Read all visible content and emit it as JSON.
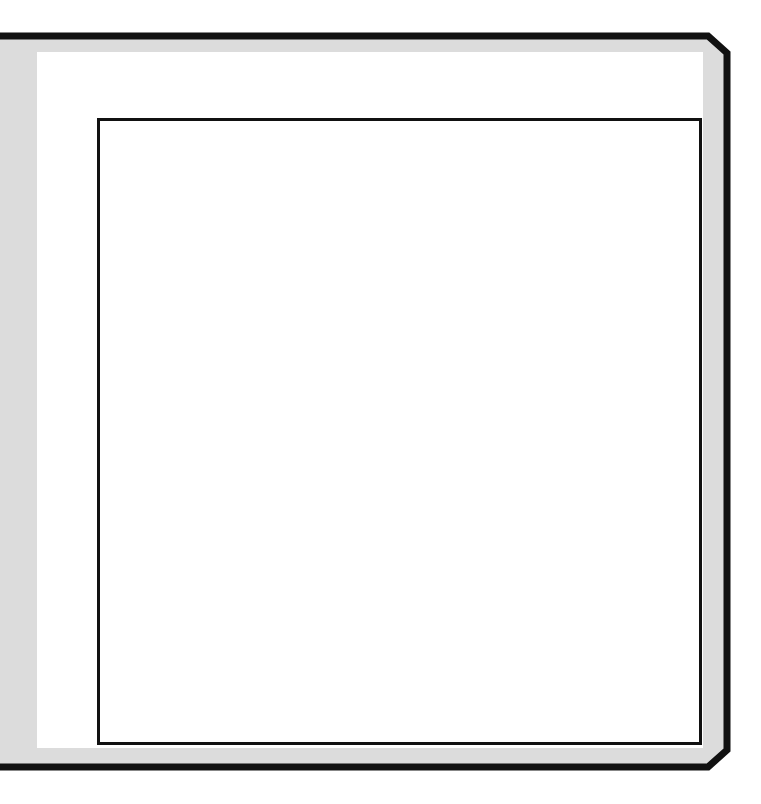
{
  "puzzle": {
    "rows": 10,
    "cols": 10,
    "col_clues": [
      {
        "col": 1,
        "value": "5"
      },
      {
        "col": 2,
        "value": "4"
      },
      {
        "col": 4,
        "value": "4"
      },
      {
        "col": 5,
        "value": "3"
      },
      {
        "col": 8,
        "value": "3"
      },
      {
        "col": 9,
        "value": "4"
      }
    ],
    "row_clues": [
      {
        "row": 1,
        "value": "6"
      },
      {
        "row": 4,
        "value": "3"
      },
      {
        "row": 6,
        "value": "3"
      },
      {
        "row": 7,
        "value": "6"
      },
      {
        "row": 10,
        "value": "4"
      }
    ],
    "dots": [
      {
        "row": 4,
        "col": 2
      },
      {
        "row": 6,
        "col": 1
      }
    ]
  },
  "colors": {
    "frame": "#111111",
    "band": "#dcdcdc",
    "panel": "#ffffff",
    "grid_line": "#222222",
    "dot": "#0d0d0d",
    "clue_text": "#1a1a1a"
  }
}
